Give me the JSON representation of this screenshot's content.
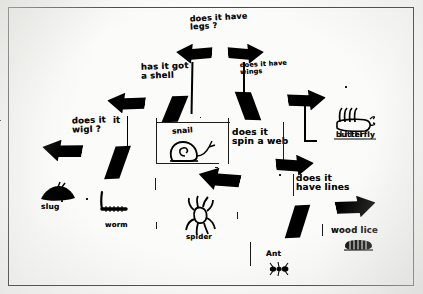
{
  "document": {
    "kind": "hand-drawn branching key worksheet",
    "title_text": "does it have legs?"
  },
  "questions": [
    {
      "id": "q-legs",
      "text": "does it have\nlegs ?"
    },
    {
      "id": "q-shell",
      "text": "has it got\na shell"
    },
    {
      "id": "q-wings",
      "text": "does it have\nwings"
    },
    {
      "id": "q-wiggle",
      "text": "does it\nwigl ?"
    },
    {
      "id": "q-web",
      "text": "does it\nspin a web"
    },
    {
      "id": "q-lines",
      "text": "does it\nhave lines"
    }
  ],
  "answers": [
    {
      "id": "a-slug",
      "label": "slug"
    },
    {
      "id": "a-worm",
      "label": "worm"
    },
    {
      "id": "a-snail",
      "label": "snail"
    },
    {
      "id": "a-spider",
      "label": "spider"
    },
    {
      "id": "a-ant",
      "label": "Ant"
    },
    {
      "id": "a-woodlice",
      "label": "wood lice"
    },
    {
      "id": "a-butterfly",
      "label": "butterfly"
    }
  ],
  "colors": {
    "ink": "#000000",
    "paper": "#fbfbf9",
    "border": "#4a4a4a"
  }
}
